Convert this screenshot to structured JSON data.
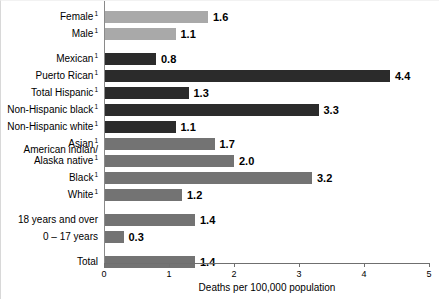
{
  "chart_data": {
    "type": "bar",
    "orientation": "horizontal",
    "title": "",
    "subtitle": "",
    "xlabel": "Deaths per 100,000 population",
    "ylabel": "",
    "xlim": [
      0,
      5
    ],
    "xticks": [
      0,
      1,
      2,
      3,
      4,
      5
    ],
    "xtick_labels": [
      "0",
      "1",
      "2",
      "3",
      "4",
      "5"
    ],
    "grid": false,
    "legend": "none",
    "categories": [
      "Female",
      "Male",
      "Mexican",
      "Puerto Rican",
      "Total Hispanic",
      "Non-Hispanic black",
      "Non-Hispanic white",
      "Asian",
      "American indian/ Alaska native",
      "Black",
      "White",
      "18 years and over",
      "0 – 17 years",
      "Total"
    ],
    "values": [
      1.6,
      1.1,
      0.8,
      4.4,
      1.3,
      3.3,
      1.1,
      1.7,
      2.0,
      3.2,
      1.2,
      1.4,
      0.3,
      1.4
    ],
    "value_labels": [
      "1.6",
      "1.1",
      "0.8",
      "4.4",
      "1.3",
      "3.3",
      "1.1",
      "1.7",
      "2.0",
      "3.2",
      "1.2",
      "1.4",
      "0.3",
      "1.4"
    ]
  },
  "colors": {
    "bar_light": "#a9a9a9",
    "bar_medium": "#737373",
    "bar_dark": "#2b2b2b",
    "axis": "#6f6f6f",
    "text": "#000000",
    "background": "#ffffff"
  },
  "axis": {
    "x_title": "Deaths per 100,000 population",
    "ticks": [
      {
        "label": "0",
        "value": 0
      },
      {
        "label": "1",
        "value": 1
      },
      {
        "label": "2",
        "value": 2
      },
      {
        "label": "3",
        "value": 3
      },
      {
        "label": "4",
        "value": 4
      },
      {
        "label": "5",
        "value": 5
      }
    ]
  },
  "footnote_marker": "1",
  "rows": [
    {
      "label": "Female",
      "label_line2": "",
      "footnote": true,
      "value": 1.6,
      "value_label": "1.6",
      "shade": "light",
      "y": 10
    },
    {
      "label": "Male",
      "label_line2": "",
      "footnote": true,
      "value": 1.1,
      "value_label": "1.1",
      "shade": "light",
      "y": 27
    },
    {
      "label": "Mexican",
      "label_line2": "",
      "footnote": true,
      "value": 0.8,
      "value_label": "0.8",
      "shade": "dark",
      "y": 52
    },
    {
      "label": "Puerto Rican",
      "label_line2": "",
      "footnote": true,
      "value": 4.4,
      "value_label": "4.4",
      "shade": "dark",
      "y": 69
    },
    {
      "label": "Total Hispanic",
      "label_line2": "",
      "footnote": true,
      "value": 1.3,
      "value_label": "1.3",
      "shade": "dark",
      "y": 86
    },
    {
      "label": "Non-Hispanic black",
      "label_line2": "",
      "footnote": true,
      "value": 3.3,
      "value_label": "3.3",
      "shade": "dark",
      "y": 103
    },
    {
      "label": "Non-Hispanic white",
      "label_line2": "",
      "footnote": true,
      "value": 1.1,
      "value_label": "1.1",
      "shade": "dark",
      "y": 120
    },
    {
      "label": "Asian",
      "label_line2": "",
      "footnote": true,
      "value": 1.7,
      "value_label": "1.7",
      "shade": "medium",
      "y": 137
    },
    {
      "label": "American indian/",
      "label_line2": "Alaska native",
      "footnote": true,
      "value": 2.0,
      "value_label": "2.0",
      "shade": "medium",
      "y": 154
    },
    {
      "label": "Black",
      "label_line2": "",
      "footnote": true,
      "value": 3.2,
      "value_label": "3.2",
      "shade": "medium",
      "y": 171
    },
    {
      "label": "White",
      "label_line2": "",
      "footnote": true,
      "value": 1.2,
      "value_label": "1.2",
      "shade": "medium",
      "y": 188
    },
    {
      "label": "18 years and over",
      "label_line2": "",
      "footnote": false,
      "value": 1.4,
      "value_label": "1.4",
      "shade": "medium",
      "y": 213
    },
    {
      "label": "0 – 17 years",
      "label_line2": "",
      "footnote": false,
      "value": 0.3,
      "value_label": "0.3",
      "shade": "medium",
      "y": 230
    },
    {
      "label": "Total",
      "label_line2": "",
      "footnote": false,
      "value": 1.4,
      "value_label": "1.4",
      "shade": "medium",
      "y": 255
    }
  ]
}
